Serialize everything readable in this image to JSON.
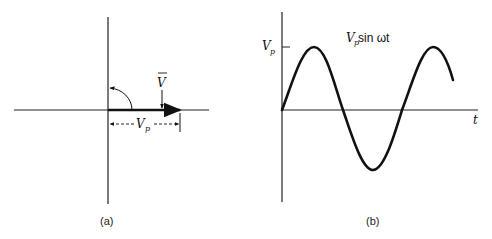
{
  "figure_a": {
    "caption": "(a)",
    "phasor_label": "V",
    "phasor_label_bar": "‾",
    "magnitude_label": "V",
    "magnitude_subscript": "p",
    "description": "Phasor diagram: vector V along positive real axis with length Vp, counter-clockwise rotation arrow"
  },
  "figure_b": {
    "caption": "(b)",
    "y_tick_label": "V",
    "y_tick_subscript": "p",
    "x_axis_label": "t",
    "curve_label_prefix": "V",
    "curve_label_subscript": "p",
    "curve_label_suffix": " sin ωt",
    "description": "Sinusoidal waveform Vp sin ωt over about 1.7 cycles"
  },
  "colors": {
    "ink": "#111111",
    "background": "#ffffff"
  }
}
